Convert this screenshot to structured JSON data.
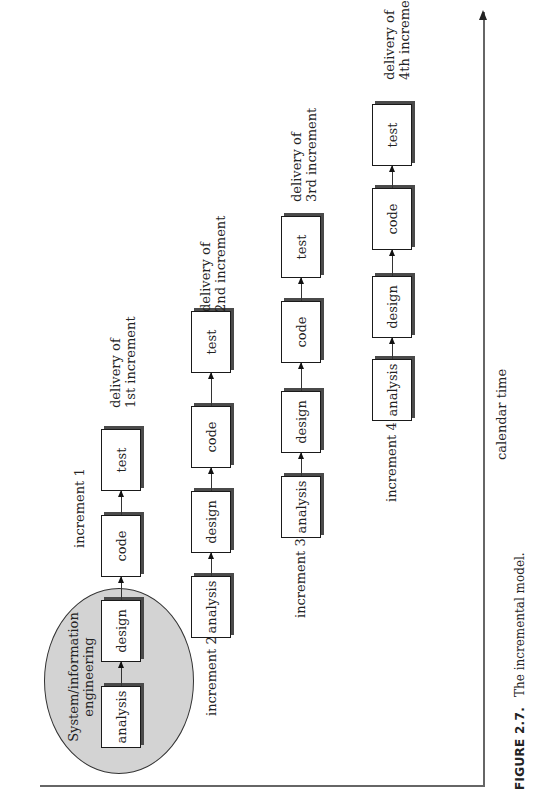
{
  "figure": {
    "caption_label": "FIGURE 2.7.",
    "caption_text": "The incremental model."
  },
  "diagram": {
    "orientation": "rotated 90° counter-clockwise (text reads bottom-to-top)",
    "phase_group": {
      "label_line1": "System/information",
      "label_line2": "engineering",
      "fill_color": "#d3d3d3"
    },
    "axis": {
      "label": "calendar time"
    },
    "increments": [
      {
        "label": "increment 1",
        "stages": [
          "analysis",
          "design",
          "code",
          "test"
        ],
        "delivery_line1": "delivery of",
        "delivery_line2": "1st increment"
      },
      {
        "label": "increment 2",
        "stages": [
          "analysis",
          "design",
          "code",
          "test"
        ],
        "delivery_line1": "delivery of",
        "delivery_line2": "2nd increment"
      },
      {
        "label": "increment 3",
        "stages": [
          "analysis",
          "design",
          "code",
          "test"
        ],
        "delivery_line1": "delivery of",
        "delivery_line2": "3rd increment"
      },
      {
        "label": "increment 4",
        "stages": [
          "analysis",
          "design",
          "code",
          "test"
        ],
        "delivery_line1": "delivery of",
        "delivery_line2": "4th increment"
      }
    ]
  }
}
